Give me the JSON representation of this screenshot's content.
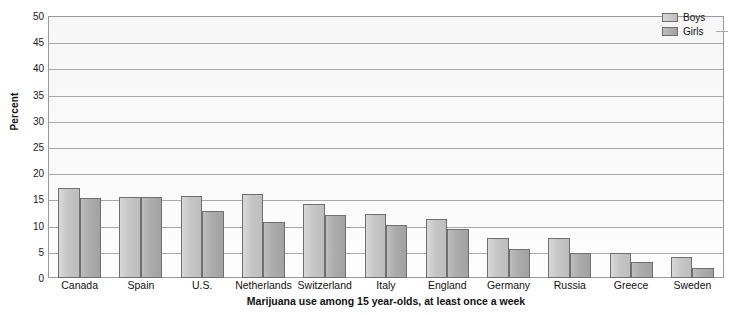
{
  "chart_data": {
    "type": "bar",
    "title": "Marijuana use among 15 year-olds, at least once a week",
    "xlabel": "Marijuana use among 15 year-olds, at least once a week",
    "ylabel": "Percent",
    "ylim": [
      0,
      50
    ],
    "ytick_step": 5,
    "yticks": [
      50,
      45,
      40,
      35,
      30,
      25,
      20,
      15,
      10,
      5,
      0
    ],
    "grid": true,
    "legend_position": "top-right",
    "categories": [
      "Canada",
      "Spain",
      "U.S.",
      "Netherlands",
      "Switzerland",
      "Italy",
      "England",
      "Germany",
      "Russia",
      "Greece",
      "Sweden"
    ],
    "series": [
      {
        "name": "Boys",
        "color": "#c6c6c6",
        "values": [
          17.2,
          15.5,
          15.8,
          16.0,
          14.2,
          12.3,
          11.3,
          7.6,
          7.7,
          4.8,
          4.0
        ]
      },
      {
        "name": "Girls",
        "color": "#ababab",
        "values": [
          15.4,
          15.5,
          12.8,
          10.8,
          12.1,
          10.2,
          9.4,
          5.5,
          4.7,
          3.0,
          2.0
        ]
      }
    ]
  },
  "legend": {
    "items": [
      {
        "label": "Boys"
      },
      {
        "label": "Girls"
      }
    ]
  },
  "axes": {
    "y_title": "Percent"
  },
  "colors": {
    "boys": "#c6c6c6",
    "girls": "#ababab",
    "grid": "#a8a8a8",
    "axis": "#9a9a9a",
    "text": "#111111"
  }
}
